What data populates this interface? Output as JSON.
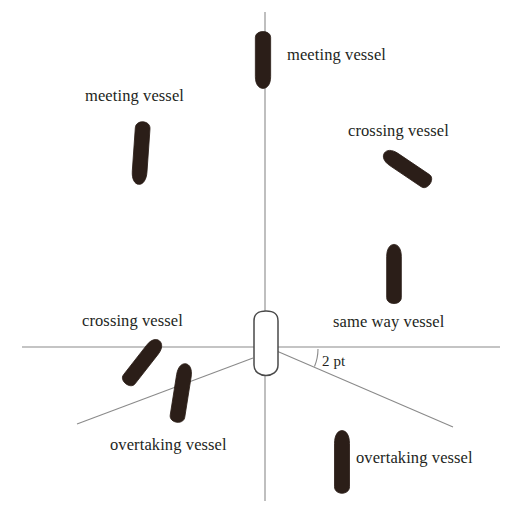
{
  "diagram": {
    "canvas": {
      "width": 518,
      "height": 509,
      "background": "#ffffff"
    },
    "colors": {
      "vessel_fill": "#2b1e18",
      "vessel_outline": "#3a3a3a",
      "own_vessel_fill": "#ffffff",
      "line": "#8a8a8a",
      "text": "#231f1c"
    },
    "labels": {
      "meeting_top": "meeting vessel",
      "meeting_left": "meeting vessel",
      "crossing_right": "crossing vessel",
      "crossing_left": "crossing vessel",
      "same_way": "same way vessel",
      "overtaking_left": "overtaking vessel",
      "overtaking_right": "overtaking vessel",
      "angle": "2 pt"
    },
    "lines": [
      {
        "name": "vertical-axis",
        "x1": 265,
        "y1": 12,
        "x2": 265,
        "y2": 501
      },
      {
        "name": "horizontal-axis",
        "x1": 22,
        "y1": 347,
        "x2": 500,
        "y2": 347
      },
      {
        "name": "sector-boundary-left",
        "x1": 253,
        "y1": 358,
        "x2": 77,
        "y2": 424
      },
      {
        "name": "sector-boundary-right",
        "x1": 272,
        "y1": 349,
        "x2": 453,
        "y2": 427
      }
    ],
    "angle_arc": {
      "name": "two-point-angle-arc",
      "cx": 272,
      "cy": 349,
      "r": 46,
      "start_deg": 0,
      "end_deg": 23
    },
    "vessels": [
      {
        "name": "meeting-vessel-top",
        "cx": 263,
        "cy": 59,
        "w": 16,
        "h": 58,
        "rot": 0,
        "heading": "down",
        "filled": true
      },
      {
        "name": "meeting-vessel-left",
        "cx": 141,
        "cy": 152,
        "w": 15,
        "h": 64,
        "rot": 4,
        "heading": "down",
        "filled": true
      },
      {
        "name": "crossing-vessel-right",
        "cx": 408,
        "cy": 169,
        "w": 15,
        "h": 55,
        "rot": 124,
        "heading": "down",
        "filled": true
      },
      {
        "name": "same-way-vessel",
        "cx": 394,
        "cy": 275,
        "w": 15,
        "h": 60,
        "rot": 180,
        "heading": "up",
        "filled": true
      },
      {
        "name": "crossing-vessel-left",
        "cx": 142,
        "cy": 363,
        "w": 15,
        "h": 54,
        "rot": 218,
        "heading": "up",
        "filled": true
      },
      {
        "name": "overtaking-vessel-left",
        "cx": 181,
        "cy": 394,
        "w": 15,
        "h": 59,
        "rot": 189,
        "heading": "up",
        "filled": true
      },
      {
        "name": "overtaking-vessel-right",
        "cx": 342,
        "cy": 463,
        "w": 15,
        "h": 63,
        "rot": 180,
        "heading": "up",
        "filled": true
      },
      {
        "name": "own-vessel",
        "cx": 266,
        "cy": 347,
        "w": 26,
        "h": 72,
        "rot": 180,
        "heading": "up",
        "filled": false
      }
    ]
  }
}
